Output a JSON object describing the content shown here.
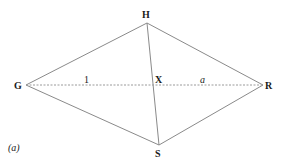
{
  "figure": {
    "caption": "(a)",
    "points": {
      "G": {
        "label": "G",
        "x": 26,
        "y": 85
      },
      "H": {
        "label": "H",
        "x": 147,
        "y": 23
      },
      "X": {
        "label": "X",
        "x": 153,
        "y": 85
      },
      "R": {
        "label": "R",
        "x": 263,
        "y": 85
      },
      "S": {
        "label": "S",
        "x": 159,
        "y": 145
      }
    },
    "segment_labels": {
      "GX": "1",
      "XR": "a"
    },
    "colors": {
      "line": "#8a8a8a",
      "text": "#1a1a1a",
      "background": "#ffffff"
    }
  }
}
